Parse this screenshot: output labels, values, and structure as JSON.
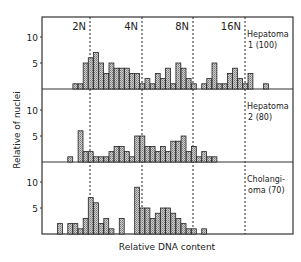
{
  "chart_data": {
    "type": "bar",
    "title": "",
    "xlabel": "Relative DNA content",
    "ylabel": "Relative of nuclei",
    "ploidy_markers": [
      "2N",
      "4N",
      "8N",
      "16N"
    ],
    "y_ticks": [
      5,
      10
    ],
    "panels": [
      {
        "name": "Hepatoma 1 (100)",
        "label_lines": [
          "Hepatoma",
          "1 (100)"
        ],
        "start_bin": 6,
        "values": [
          1,
          1,
          5,
          6,
          7,
          5,
          3,
          5,
          4,
          4,
          4,
          3,
          3,
          1,
          2,
          1,
          3,
          2,
          4,
          1,
          5,
          4,
          2,
          1,
          0,
          1,
          2,
          5,
          1,
          1,
          3,
          4,
          2,
          1,
          3,
          0,
          0,
          1
        ]
      },
      {
        "name": "Hepatoma 2 (80)",
        "label_lines": [
          "Hepatoma",
          "2 (80)"
        ],
        "start_bin": 5,
        "values": [
          1,
          0,
          6,
          2,
          2,
          1,
          1,
          1,
          2,
          3,
          3,
          2,
          1,
          5,
          5,
          3,
          3,
          2,
          3,
          2,
          4,
          4,
          5,
          2,
          3,
          1,
          2,
          1,
          1
        ]
      },
      {
        "name": "Cholangioma (70)",
        "label_lines": [
          "Cholangi-",
          "oma (70)"
        ],
        "start_bin": 3,
        "values": [
          2,
          0,
          2,
          2,
          1,
          3,
          7,
          6,
          2,
          3,
          1,
          0,
          3,
          0,
          0,
          9,
          5,
          5,
          3,
          4,
          5,
          5,
          4,
          3,
          2,
          1,
          1,
          0,
          1
        ]
      }
    ]
  },
  "labels": {
    "xlabel": "Relative DNA content",
    "ylabel": "Relative of nuclei",
    "m2n": "2N",
    "m4n": "4N",
    "m8n": "8N",
    "m16n": "16N",
    "p1a": "Hepatoma",
    "p1b": "1 (100)",
    "p2a": "Hepatoma",
    "p2b": "2 (80)",
    "p3a": "Cholangi-",
    "p3b": "oma (70)",
    "t10": "10",
    "t5": "5"
  }
}
